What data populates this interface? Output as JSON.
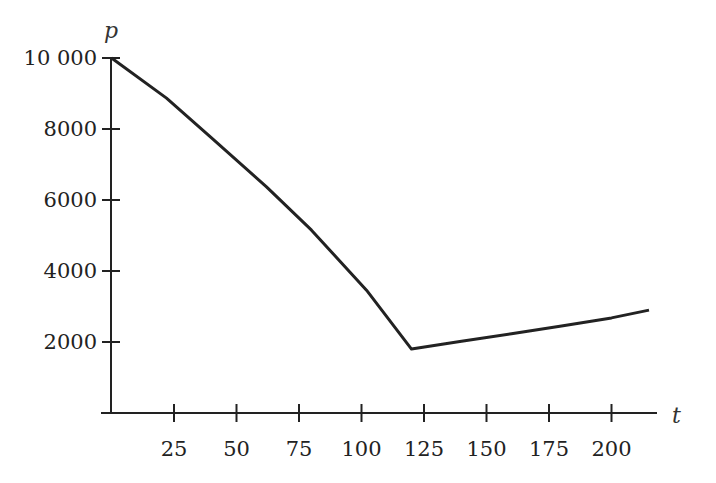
{
  "chart_data": {
    "type": "line",
    "title": "",
    "xlabel": "t",
    "ylabel": "p",
    "xlim": [
      0,
      220
    ],
    "ylim": [
      0,
      10000
    ],
    "grid": false,
    "legend": null,
    "x_ticks": [
      25,
      50,
      75,
      100,
      125,
      150,
      175,
      200
    ],
    "x_tick_labels": [
      "25",
      "50",
      "75",
      "100",
      "125",
      "150",
      "175",
      "200"
    ],
    "y_ticks": [
      2000,
      4000,
      6000,
      8000,
      10000
    ],
    "y_tick_labels": [
      "2000",
      "4000",
      "6000",
      "8000",
      "10 000"
    ],
    "series": [
      {
        "name": "p(t)",
        "x": [
          0,
          22,
          40,
          62,
          80,
          102,
          120,
          140,
          160,
          180,
          200,
          215
        ],
        "y": [
          10000,
          8870,
          7750,
          6370,
          5150,
          3460,
          1800,
          2020,
          2230,
          2450,
          2680,
          2900
        ]
      }
    ]
  }
}
